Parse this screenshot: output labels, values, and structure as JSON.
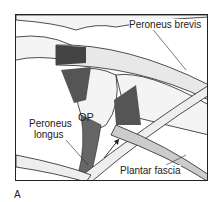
{
  "figure": {
    "panel_label": "A",
    "labels": {
      "peroneus_brevis": "Peroneus brevis",
      "peroneus_longus_line1": "Peroneus",
      "peroneus_longus_line2": "longus",
      "os_peroneum": "OP",
      "plantar_fascia": "Plantar fascia"
    },
    "colors": {
      "line": "#222222",
      "bone": "#f4f4f4",
      "shade": "#555555"
    }
  }
}
